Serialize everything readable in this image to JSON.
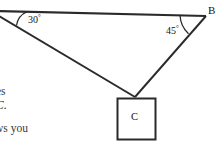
{
  "figure": {
    "background_color": "#ffffff",
    "stroke_color": "#2a2a2a",
    "vertices": {
      "b_label": "B",
      "c_label": "C"
    },
    "angles": [
      {
        "name": "angle-at-left-vertex",
        "value": "30",
        "degree_symbol": "°"
      },
      {
        "name": "angle-at-b",
        "value": "45",
        "degree_symbol": "°"
      }
    ],
    "box": {
      "label": "C"
    },
    "text_fragments": [
      {
        "name": "fragment-es",
        "text": "es"
      },
      {
        "name": "fragment-c-period",
        "text": "C."
      },
      {
        "name": "fragment-ws-you",
        "text": "ws you"
      }
    ]
  }
}
